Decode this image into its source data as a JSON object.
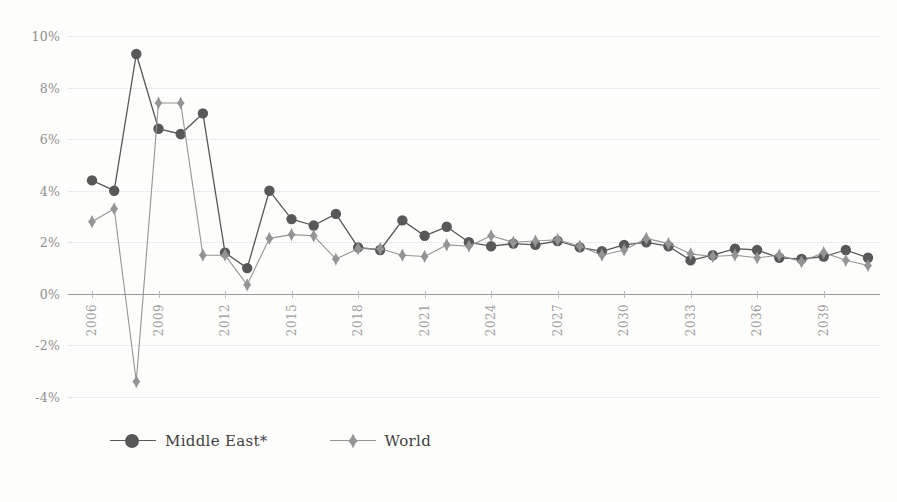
{
  "chart_data": {
    "type": "line",
    "title": "",
    "subtitle": "",
    "xlabel": "",
    "ylabel": "",
    "grid": true,
    "legend_position": "bottom-left",
    "ylim": [
      -4,
      10
    ],
    "ytick_values": [
      10,
      8,
      6,
      4,
      2,
      0,
      -2,
      -4
    ],
    "ytick_labels": [
      "10%",
      "8%",
      "6%",
      "4%",
      "2%",
      "0%",
      "-2%",
      "-4%"
    ],
    "x": [
      2006,
      2007,
      2008,
      2009,
      2010,
      2011,
      2012,
      2013,
      2014,
      2015,
      2016,
      2017,
      2018,
      2019,
      2020,
      2021,
      2022,
      2023,
      2024,
      2025,
      2026,
      2027,
      2028,
      2029,
      2030,
      2031,
      2032,
      2033,
      2034,
      2035,
      2036,
      2037,
      2038,
      2039,
      2040,
      2041
    ],
    "xtick_labels": [
      "2006",
      "2009",
      "2012",
      "2015",
      "2018",
      "2021",
      "2024",
      "2027",
      "2030",
      "2033",
      "2036",
      "2039"
    ],
    "xtick_values": [
      2006,
      2009,
      2012,
      2015,
      2018,
      2021,
      2024,
      2027,
      2030,
      2033,
      2036,
      2039
    ],
    "series": [
      {
        "name": "Middle East*",
        "marker": "circle",
        "color": "#585858",
        "values": [
          4.4,
          4.0,
          9.3,
          6.4,
          6.2,
          7.0,
          1.6,
          1.0,
          4.0,
          2.9,
          2.65,
          3.1,
          1.8,
          1.7,
          2.85,
          2.25,
          2.6,
          2.0,
          1.85,
          1.95,
          1.9,
          2.05,
          1.8,
          1.65,
          1.9,
          2.0,
          1.85,
          1.3,
          1.5,
          1.75,
          1.7,
          1.4,
          1.35,
          1.45,
          1.7,
          1.4
        ]
      },
      {
        "name": "World",
        "marker": "diamond",
        "color": "#949494",
        "values": [
          2.8,
          3.3,
          -3.4,
          7.4,
          7.4,
          1.5,
          1.5,
          0.35,
          2.15,
          2.3,
          2.25,
          1.35,
          1.75,
          1.75,
          1.5,
          1.45,
          1.9,
          1.85,
          2.25,
          2.0,
          2.05,
          2.1,
          1.85,
          1.5,
          1.7,
          2.15,
          1.95,
          1.55,
          1.45,
          1.5,
          1.4,
          1.5,
          1.25,
          1.6,
          1.3,
          1.1
        ]
      }
    ]
  },
  "legend": {
    "items": [
      {
        "label": "Middle East*",
        "marker": "circle-marker-icon"
      },
      {
        "label": "World",
        "marker": "diamond-marker-icon"
      }
    ]
  },
  "colors": {
    "background": "#fdfdfb",
    "gridline": "#d8dce4",
    "zero_line": "#9a9a9a",
    "series_middle_east": "#585858",
    "series_world": "#949494",
    "tick_text": "#8e8e8e"
  }
}
